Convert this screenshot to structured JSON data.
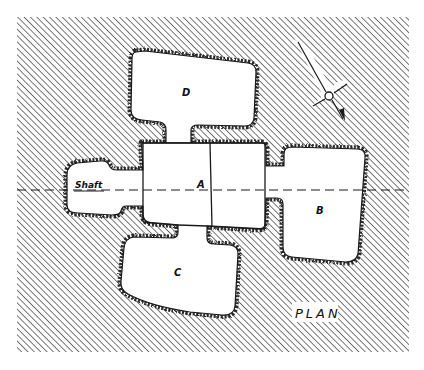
{
  "diagram": {
    "title": "PLAN",
    "colors": {
      "background": "#ffffff",
      "hatch": "#555555",
      "outline": "#1a1a1a",
      "rock_edge": "#3a3a3a"
    },
    "frame": {
      "x": 17,
      "y": 17,
      "width": 392,
      "height": 335
    },
    "section_line": {
      "y": 190,
      "x_start": 17,
      "x_end": 408,
      "style": "dashed"
    },
    "rooms": [
      {
        "id": "A",
        "label": "A",
        "description": "central chamber, divided in two"
      },
      {
        "id": "B",
        "label": "B",
        "description": "east chamber"
      },
      {
        "id": "C",
        "label": "C",
        "description": "south chamber"
      },
      {
        "id": "D",
        "label": "D",
        "description": "north chamber"
      },
      {
        "id": "shaft",
        "label": "Shaft",
        "description": "entrance shaft, west"
      }
    ],
    "compass": {
      "icon": "north-arrow-icon",
      "orientation_deg": 150
    },
    "plan_label": "PLAN"
  }
}
